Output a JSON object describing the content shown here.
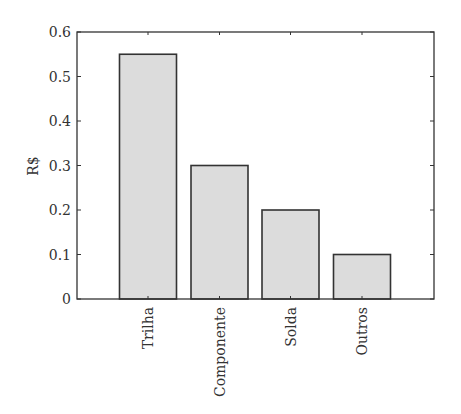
{
  "chart_data": {
    "type": "bar",
    "title": "",
    "xlabel": "",
    "ylabel": "R$",
    "categories": [
      "Trilha",
      "Componente",
      "Solda",
      "Outros"
    ],
    "values": [
      0.55,
      0.3,
      0.2,
      0.1
    ],
    "ylim": [
      0,
      0.6
    ],
    "yticks": [
      0,
      0.1,
      0.2,
      0.3,
      0.4,
      0.5,
      0.6
    ],
    "ytick_labels": [
      "0",
      "0.1",
      "0.2",
      "0.3",
      "0.4",
      "0.5",
      "0.6"
    ],
    "grid": false,
    "legend": null,
    "colors": {
      "bar_fill": "#dcdcdc",
      "bar_edge": "#333333",
      "axis": "#333333"
    }
  }
}
